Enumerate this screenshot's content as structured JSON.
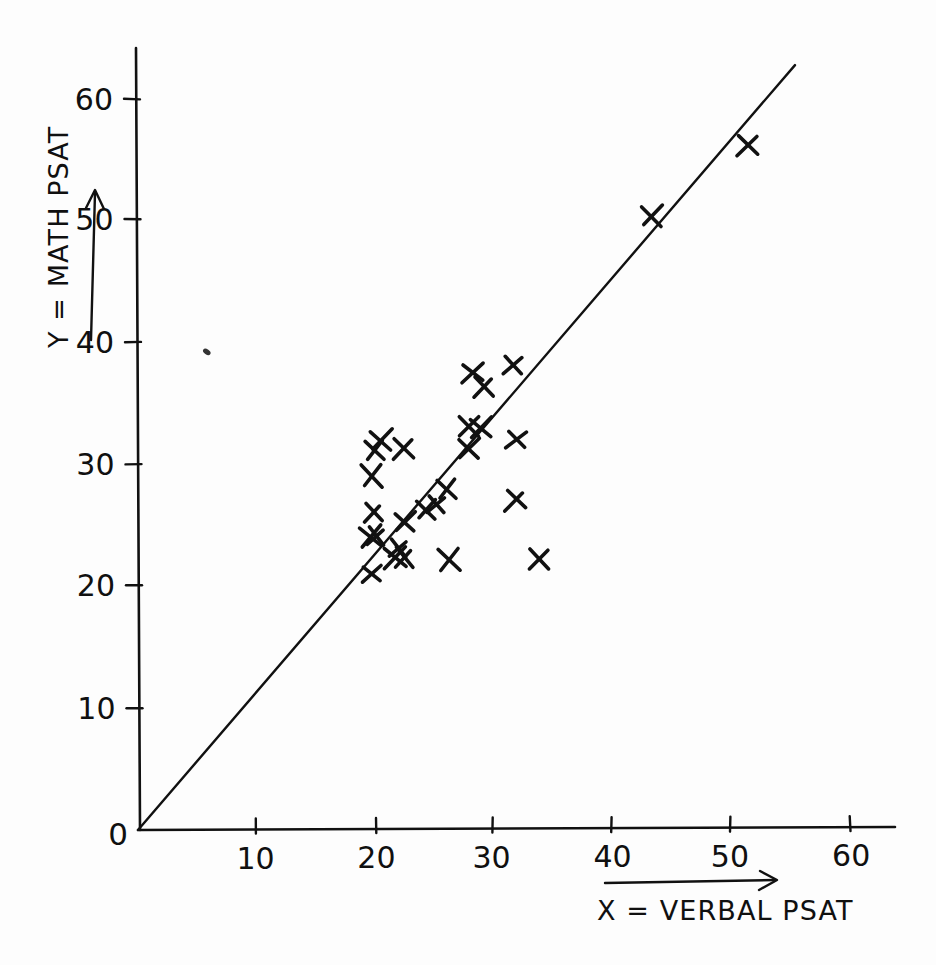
{
  "figure": {
    "background_color": "#fdfdfd",
    "ink_color": "#111111",
    "style": "hand-drawn pencil/ink scatterplot on white paper"
  },
  "chart_data": {
    "type": "scatter",
    "title": "",
    "subtitle": "",
    "xlabel": "X = VERBAL PSAT",
    "ylabel": "Y = MATH PSAT",
    "origin_label": "0",
    "xlim": [
      0,
      62
    ],
    "ylim": [
      0,
      64
    ],
    "xticks": [
      10,
      20,
      30,
      40,
      50,
      60
    ],
    "yticks": [
      10,
      20,
      30,
      40,
      50,
      60
    ],
    "xtick_labels": [
      "10",
      "20",
      "30",
      "40",
      "50",
      "60"
    ],
    "ytick_labels": [
      "10",
      "20",
      "30",
      "40",
      "50",
      "60"
    ],
    "grid": false,
    "legend": null,
    "marker": "x",
    "marker_color": "#111111",
    "points": [
      {
        "x": 19.7,
        "y": 21.0
      },
      {
        "x": 19.6,
        "y": 24.1
      },
      {
        "x": 20.1,
        "y": 24.0
      },
      {
        "x": 19.8,
        "y": 26.0
      },
      {
        "x": 19.8,
        "y": 29.0
      },
      {
        "x": 19.9,
        "y": 31.2
      },
      {
        "x": 20.5,
        "y": 32.0
      },
      {
        "x": 22.4,
        "y": 31.2
      },
      {
        "x": 21.7,
        "y": 22.3
      },
      {
        "x": 22.4,
        "y": 22.3
      },
      {
        "x": 22.0,
        "y": 23.0
      },
      {
        "x": 22.6,
        "y": 25.2
      },
      {
        "x": 24.3,
        "y": 26.3
      },
      {
        "x": 25.2,
        "y": 26.6
      },
      {
        "x": 26.0,
        "y": 28.0
      },
      {
        "x": 26.2,
        "y": 22.2
      },
      {
        "x": 28.0,
        "y": 31.2
      },
      {
        "x": 28.0,
        "y": 33.0
      },
      {
        "x": 28.9,
        "y": 33.0
      },
      {
        "x": 28.2,
        "y": 37.5
      },
      {
        "x": 29.1,
        "y": 36.3
      },
      {
        "x": 31.7,
        "y": 38.0
      },
      {
        "x": 31.9,
        "y": 32.0
      },
      {
        "x": 31.8,
        "y": 27.0
      },
      {
        "x": 33.8,
        "y": 22.2
      },
      {
        "x": 43.3,
        "y": 50.4
      },
      {
        "x": 51.3,
        "y": 56.2
      }
    ],
    "fit_line": {
      "label": "",
      "through_origin": true,
      "x_start": 0.0,
      "y_start": 0.0,
      "x_end": 55.4,
      "y_end": 62.7,
      "slope": 1.132,
      "intercept": 0.0
    },
    "stray_mark": {
      "x": 5.8,
      "y": 39.2
    }
  },
  "axes": {
    "x_axis_name": "x-axis",
    "y_axis_name": "y-axis",
    "x_arrow_name": "x-axis-direction-arrow",
    "y_arrow_name": "y-axis-direction-arrow"
  }
}
